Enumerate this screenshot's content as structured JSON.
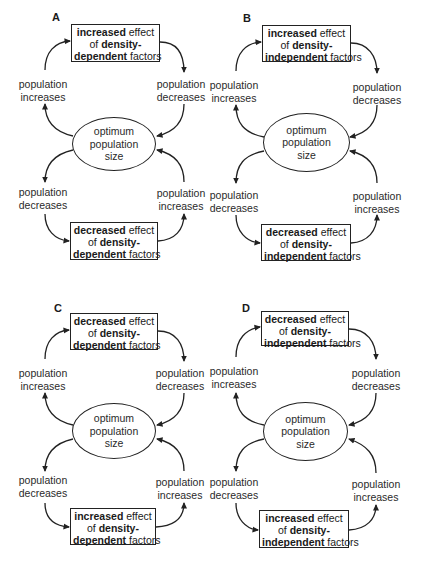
{
  "figure": {
    "panels": [
      {
        "id": "A",
        "label": "A",
        "top_box": {
          "bold1": "increased",
          "text1": " effect",
          "text2": "of ",
          "bold2": "density-",
          "bold3": "dependent",
          "text3": " factors"
        },
        "bottom_box": {
          "bold1": "decreased",
          "text1": " effect",
          "text2": "of ",
          "bold2": "density-",
          "bold3": "dependent",
          "text3": " factors"
        },
        "upper_left": {
          "line1": "population",
          "line2": "increases"
        },
        "upper_right": {
          "line1": "population",
          "line2": "decreases"
        },
        "lower_left": {
          "line1": "population",
          "line2": "decreases"
        },
        "lower_right": {
          "line1": "population",
          "line2": "increases"
        },
        "center": {
          "line1": "optimum",
          "line2": "population",
          "line3": "size"
        }
      },
      {
        "id": "B",
        "label": "B",
        "top_box": {
          "bold1": "increased",
          "text1": " effect",
          "text2": "of ",
          "bold2": "density-",
          "bold3": "independent",
          "text3": " factors"
        },
        "bottom_box": {
          "bold1": "decreased",
          "text1": " effect",
          "text2": "of ",
          "bold2": "density-",
          "bold3": "independent",
          "text3": " factors"
        },
        "upper_left": {
          "line1": "population",
          "line2": "increases"
        },
        "upper_right": {
          "line1": "population",
          "line2": "decreases"
        },
        "lower_left": {
          "line1": "population",
          "line2": "decreases"
        },
        "lower_right": {
          "line1": "population",
          "line2": "increases"
        },
        "center": {
          "line1": "optimum",
          "line2": "population",
          "line3": "size"
        }
      },
      {
        "id": "C",
        "label": "C",
        "top_box": {
          "bold1": "decreased",
          "text1": " effect",
          "text2": "of ",
          "bold2": "density-",
          "bold3": "dependent",
          "text3": " factors"
        },
        "bottom_box": {
          "bold1": "increased",
          "text1": " effect",
          "text2": "of ",
          "bold2": "density-",
          "bold3": "dependent",
          "text3": " factors"
        },
        "upper_left": {
          "line1": "population",
          "line2": "increases"
        },
        "upper_right": {
          "line1": "population",
          "line2": "decreases"
        },
        "lower_left": {
          "line1": "population",
          "line2": "decreases"
        },
        "lower_right": {
          "line1": "population",
          "line2": "increases"
        },
        "center": {
          "line1": "optimum",
          "line2": "population",
          "line3": "size"
        }
      },
      {
        "id": "D",
        "label": "D",
        "top_box": {
          "bold1": "decreased",
          "text1": " effect",
          "text2": "of ",
          "bold2": "density-",
          "bold3": "independent",
          "text3": " factors"
        },
        "bottom_box": {
          "bold1": "increased",
          "text1": " effect",
          "text2": "of ",
          "bold2": "density-",
          "bold3": "independent",
          "text3": " factors"
        },
        "upper_left": {
          "line1": "population",
          "line2": "increases"
        },
        "upper_right": {
          "line1": "population",
          "line2": "decreases"
        },
        "lower_left": {
          "line1": "population",
          "line2": "decreases"
        },
        "lower_right": {
          "line1": "population",
          "line2": "increases"
        },
        "center": {
          "line1": "optimum",
          "line2": "population",
          "line3": "size"
        }
      }
    ],
    "colors": {
      "stroke": "#222222",
      "text": "#1a1a1a",
      "background": "#ffffff"
    }
  }
}
